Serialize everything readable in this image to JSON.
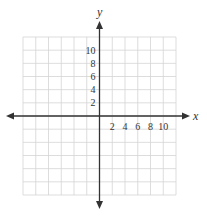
{
  "chart_data": {
    "type": "coordinate-grid",
    "title": "",
    "xlabel": "x",
    "ylabel": "y",
    "grid": true,
    "grid_columns": 12,
    "grid_rows": 12,
    "units_per_grid_line": 2,
    "xlim": [
      -12,
      12
    ],
    "ylim": [
      -12,
      12
    ],
    "x_tick_labels": [
      "2",
      "4",
      "6",
      "8",
      "10"
    ],
    "y_tick_labels": [
      "2",
      "4",
      "6",
      "8",
      "10"
    ],
    "x_tick_values": [
      2,
      4,
      6,
      8,
      10
    ],
    "y_tick_values": [
      2,
      4,
      6,
      8,
      10
    ],
    "axes_arrows": true,
    "data_points": []
  },
  "colors": {
    "grid_line": "#d4d4d4",
    "axis": "#333333",
    "text": "#333333",
    "background": "#ffffff"
  }
}
